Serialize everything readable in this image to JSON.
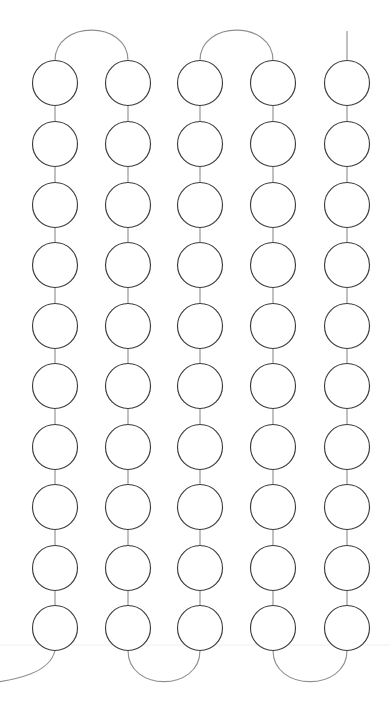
{
  "page": {
    "background_color": "#ffffff",
    "width": 390,
    "height": 709
  },
  "style": {
    "node_stroke_color": "#3c3c3c",
    "node_fill_color": "#ffffff",
    "node_stroke_width": 1.15,
    "stem_stroke_color": "#9a9a9a",
    "stem_stroke_width": 1.25,
    "arc_stroke_color": "#8f8f8f",
    "arc_stroke_width": 1.1,
    "rule_color": "#f1eef0"
  },
  "chart_data": {
    "type": "scatter",
    "xlabel": "",
    "ylabel": "",
    "xlim": [
      0,
      390
    ],
    "ylim": [
      0,
      709
    ],
    "grid": false,
    "legend": "none",
    "node_count": 50,
    "column_count": 5,
    "row_count": 10,
    "node_radius": 22.5,
    "column_centers_x": [
      55,
      128,
      200,
      273,
      347
    ],
    "row_centers_y": [
      83,
      144,
      205,
      265,
      326,
      386,
      447,
      507,
      568,
      628
    ],
    "nodes": [
      {
        "col": 1,
        "row": 1,
        "cx": 55,
        "cy": 83
      },
      {
        "col": 1,
        "row": 2,
        "cx": 55,
        "cy": 144
      },
      {
        "col": 1,
        "row": 3,
        "cx": 55,
        "cy": 205
      },
      {
        "col": 1,
        "row": 4,
        "cx": 55,
        "cy": 265
      },
      {
        "col": 1,
        "row": 5,
        "cx": 55,
        "cy": 326
      },
      {
        "col": 1,
        "row": 6,
        "cx": 55,
        "cy": 386
      },
      {
        "col": 1,
        "row": 7,
        "cx": 55,
        "cy": 447
      },
      {
        "col": 1,
        "row": 8,
        "cx": 55,
        "cy": 507
      },
      {
        "col": 1,
        "row": 9,
        "cx": 55,
        "cy": 568
      },
      {
        "col": 1,
        "row": 10,
        "cx": 55,
        "cy": 628
      },
      {
        "col": 2,
        "row": 1,
        "cx": 128,
        "cy": 83
      },
      {
        "col": 2,
        "row": 2,
        "cx": 128,
        "cy": 144
      },
      {
        "col": 2,
        "row": 3,
        "cx": 128,
        "cy": 205
      },
      {
        "col": 2,
        "row": 4,
        "cx": 128,
        "cy": 265
      },
      {
        "col": 2,
        "row": 5,
        "cx": 128,
        "cy": 326
      },
      {
        "col": 2,
        "row": 6,
        "cx": 128,
        "cy": 386
      },
      {
        "col": 2,
        "row": 7,
        "cx": 128,
        "cy": 447
      },
      {
        "col": 2,
        "row": 8,
        "cx": 128,
        "cy": 507
      },
      {
        "col": 2,
        "row": 9,
        "cx": 128,
        "cy": 568
      },
      {
        "col": 2,
        "row": 10,
        "cx": 128,
        "cy": 628
      },
      {
        "col": 3,
        "row": 1,
        "cx": 200,
        "cy": 83
      },
      {
        "col": 3,
        "row": 2,
        "cx": 200,
        "cy": 144
      },
      {
        "col": 3,
        "row": 3,
        "cx": 200,
        "cy": 205
      },
      {
        "col": 3,
        "row": 4,
        "cx": 200,
        "cy": 265
      },
      {
        "col": 3,
        "row": 5,
        "cx": 200,
        "cy": 326
      },
      {
        "col": 3,
        "row": 6,
        "cx": 200,
        "cy": 386
      },
      {
        "col": 3,
        "row": 7,
        "cx": 200,
        "cy": 447
      },
      {
        "col": 3,
        "row": 8,
        "cx": 200,
        "cy": 507
      },
      {
        "col": 3,
        "row": 9,
        "cx": 200,
        "cy": 568
      },
      {
        "col": 3,
        "row": 10,
        "cx": 200,
        "cy": 628
      },
      {
        "col": 4,
        "row": 1,
        "cx": 273,
        "cy": 83
      },
      {
        "col": 4,
        "row": 2,
        "cx": 273,
        "cy": 144
      },
      {
        "col": 4,
        "row": 3,
        "cx": 273,
        "cy": 205
      },
      {
        "col": 4,
        "row": 4,
        "cx": 273,
        "cy": 265
      },
      {
        "col": 4,
        "row": 5,
        "cx": 273,
        "cy": 326
      },
      {
        "col": 4,
        "row": 6,
        "cx": 273,
        "cy": 386
      },
      {
        "col": 4,
        "row": 7,
        "cx": 273,
        "cy": 447
      },
      {
        "col": 4,
        "row": 8,
        "cx": 273,
        "cy": 507
      },
      {
        "col": 4,
        "row": 9,
        "cx": 273,
        "cy": 568
      },
      {
        "col": 4,
        "row": 10,
        "cx": 273,
        "cy": 628
      },
      {
        "col": 5,
        "row": 1,
        "cx": 347,
        "cy": 83
      },
      {
        "col": 5,
        "row": 2,
        "cx": 347,
        "cy": 144
      },
      {
        "col": 5,
        "row": 3,
        "cx": 347,
        "cy": 205
      },
      {
        "col": 5,
        "row": 4,
        "cx": 347,
        "cy": 265
      },
      {
        "col": 5,
        "row": 5,
        "cx": 347,
        "cy": 326
      },
      {
        "col": 5,
        "row": 6,
        "cx": 347,
        "cy": 386
      },
      {
        "col": 5,
        "row": 7,
        "cx": 347,
        "cy": 447
      },
      {
        "col": 5,
        "row": 8,
        "cx": 347,
        "cy": 507
      },
      {
        "col": 5,
        "row": 9,
        "cx": 347,
        "cy": 568
      },
      {
        "col": 5,
        "row": 10,
        "cx": 347,
        "cy": 628
      }
    ],
    "turn_arcs": [
      {
        "name": "top-arc-col1-col2",
        "position": "top",
        "from_col": 1,
        "to_col": 2,
        "path": "M 55 60.5 C 55 20 128 20 128 60.5"
      },
      {
        "name": "top-arc-col3-col4",
        "position": "top",
        "from_col": 3,
        "to_col": 4,
        "path": "M 200 60.5 C 200 20 273 20 273 60.5"
      },
      {
        "name": "bottom-arc-col2-col3",
        "position": "bottom",
        "from_col": 2,
        "to_col": 3,
        "path": "M 128 650.5 C 128 692 200 692 200 650.5"
      },
      {
        "name": "bottom-arc-col4-col5",
        "position": "bottom",
        "from_col": 4,
        "to_col": 5,
        "path": "M 273 650.5 C 273 692 347 692 347 650.5"
      },
      {
        "name": "bottom-arc-col1-offscreen-left",
        "position": "bottom",
        "from_col": 1,
        "to_col": 0,
        "path": "M 55 650.5 C 50 672 20 680 -18 684"
      }
    ],
    "terminal_stubs": [
      {
        "name": "top-stub-col5",
        "position": "top",
        "col": 5,
        "path": "M 347 60.5 L 347 31"
      }
    ],
    "faint_rules": [
      {
        "name": "faint-horizontal-rule",
        "y": 645,
        "x1": 0,
        "x2": 390
      }
    ]
  }
}
